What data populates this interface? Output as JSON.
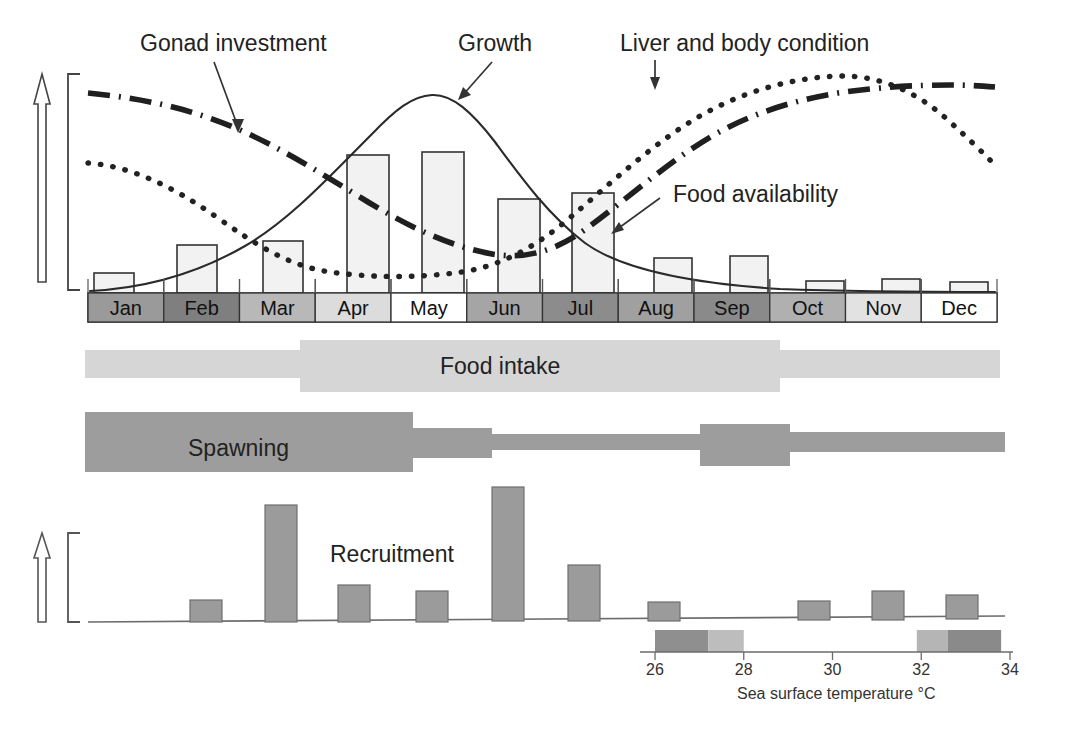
{
  "figure": {
    "title": "",
    "callouts": [
      {
        "name": "gonad-investment",
        "label": "Gonad investment",
        "x": 140,
        "y": 36
      },
      {
        "name": "growth",
        "label": "Growth",
        "x": 458,
        "y": 36
      },
      {
        "name": "liver-body-condition",
        "label": "Liver and body condition",
        "x": 620,
        "y": 36
      },
      {
        "name": "food-availability",
        "label": "Food availability",
        "x": 673,
        "y": 187
      }
    ],
    "band_labels": [
      {
        "name": "food-intake",
        "label": "Food intake",
        "x": 440,
        "y": 358
      },
      {
        "name": "spawning",
        "label": "Spawning",
        "x": 188,
        "y": 440
      },
      {
        "name": "recruitment",
        "label": "Recruitment",
        "x": 330,
        "y": 545
      }
    ]
  },
  "axis": {
    "months": [
      "Jan",
      "Feb",
      "Mar",
      "Apr",
      "May",
      "Jun",
      "Jul",
      "Aug",
      "Sep",
      "Oct",
      "Nov",
      "Dec"
    ],
    "month_shades": [
      "#9a9a9a",
      "#7f7f7f",
      "#b8b8b8",
      "#dcdcdc",
      "#ffffff",
      "#a5a5a5",
      "#8c8c8c",
      "#a0a0a0",
      "#8a8a8a",
      "#b0b0b0",
      "#e2e2e2",
      "#ffffff"
    ],
    "x_start": 88,
    "x_end": 997,
    "y_top": 293,
    "height": 29
  },
  "chart_data": {
    "type": "line",
    "xlabel": "",
    "ylabel": "",
    "categories": [
      "Jan",
      "Feb",
      "Mar",
      "Apr",
      "May",
      "Jun",
      "Jul",
      "Aug",
      "Sep",
      "Oct",
      "Nov",
      "Dec"
    ],
    "grid": false,
    "legend_position": "inline-callouts",
    "series": [
      {
        "name": "Food availability",
        "type": "bar",
        "style": "open-bar-light-gray",
        "values": [
          0.08,
          0.3,
          0.33,
          0.82,
          0.85,
          0.58,
          0.62,
          0.22,
          0.24,
          0.07,
          0.08,
          0.06
        ]
      },
      {
        "name": "Gonad investment",
        "type": "line",
        "style": "dash-dot",
        "values": [
          0.92,
          0.88,
          0.8,
          0.68,
          0.5,
          0.3,
          0.22,
          0.42,
          0.7,
          0.86,
          0.93,
          0.9
        ]
      },
      {
        "name": "Growth",
        "type": "line",
        "style": "solid",
        "values": [
          0.04,
          0.1,
          0.25,
          0.62,
          0.95,
          0.72,
          0.4,
          0.22,
          0.13,
          0.08,
          0.05,
          0.04
        ]
      },
      {
        "name": "Liver and body condition",
        "type": "line",
        "style": "dotted",
        "values": [
          0.72,
          0.52,
          0.3,
          0.18,
          0.16,
          0.3,
          0.58,
          0.82,
          0.95,
          0.97,
          0.86,
          0.62
        ]
      },
      {
        "name": "Recruitment",
        "type": "bar",
        "style": "filled-gray",
        "values": [
          0.0,
          0.1,
          0.72,
          0.25,
          0.19,
          0.88,
          0.42,
          0.08,
          0.0,
          0.09,
          0.16,
          0.13
        ]
      }
    ],
    "bands": [
      {
        "name": "Food intake",
        "segments": [
          {
            "start": "Jan",
            "end": "Mar",
            "intensity": "low"
          },
          {
            "start": "Mar",
            "end": "Aug",
            "intensity": "high"
          },
          {
            "start": "Aug",
            "end": "Dec",
            "intensity": "low"
          }
        ]
      },
      {
        "name": "Spawning",
        "segments": [
          {
            "start": "Jan",
            "end": "Apr",
            "intensity": "high"
          },
          {
            "start": "Apr",
            "end": "May",
            "intensity": "medium"
          },
          {
            "start": "May",
            "end": "Aug",
            "intensity": "low"
          },
          {
            "start": "Aug",
            "end": "Sep",
            "intensity": "medium"
          },
          {
            "start": "Sep",
            "end": "Dec",
            "intensity": "low"
          }
        ]
      }
    ]
  },
  "temperature_scale": {
    "caption": "Sea surface temperature °C",
    "ticks": [
      "26",
      "28",
      "30",
      "32",
      "34"
    ],
    "min": 26,
    "max": 34,
    "x_start": 655,
    "x_end": 1010,
    "bar_y": 630,
    "bar_height": 22,
    "segments": [
      {
        "from": 26.0,
        "to": 27.2,
        "color": "#8f8f8f"
      },
      {
        "from": 27.2,
        "to": 28.0,
        "color": "#bdbdbd"
      },
      {
        "from": 28.0,
        "to": 31.9,
        "color": "#ffffff"
      },
      {
        "from": 31.9,
        "to": 32.6,
        "color": "#b5b5b5"
      },
      {
        "from": 32.6,
        "to": 33.8,
        "color": "#8a8a8a"
      }
    ]
  },
  "colors": {
    "ink": "#222222",
    "bar_fill_light": "#f0f0f0",
    "bar_stroke": "#333333",
    "recruit_fill": "#9b9b9b",
    "band_light": "#d4d4d4",
    "band_dark": "#9e9e9e",
    "axis_line": "#555555"
  }
}
